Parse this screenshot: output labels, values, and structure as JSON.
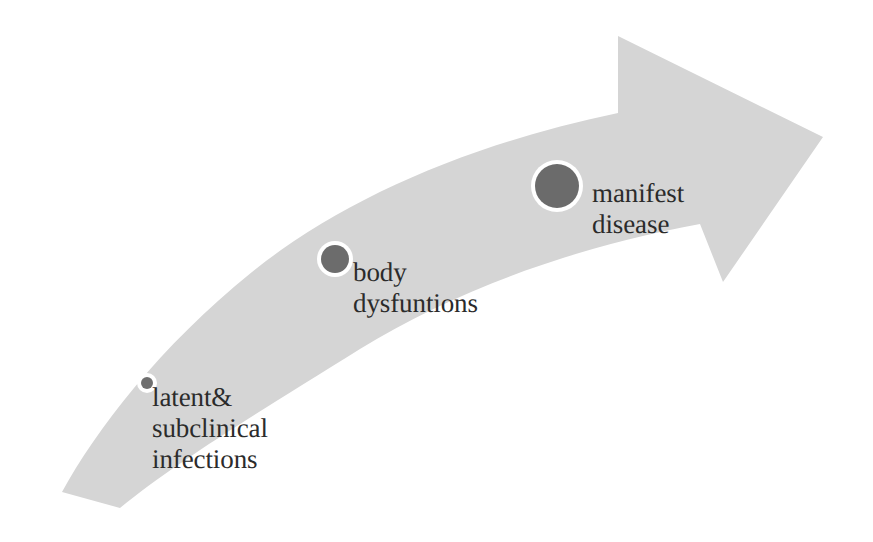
{
  "diagram": {
    "type": "process-arrow",
    "background_color": "#ffffff",
    "arrow": {
      "name": "curved-progression-arrow",
      "fill_color": "#d5d5d5",
      "direction": "left-to-right ascending",
      "description": "tapered curved arrow sweeping from lower-left to upper-right ending in an arrowhead"
    },
    "stages": [
      {
        "id": "latent",
        "label": "latent&\nsubclinical\ninfections",
        "marker_name": "stage-marker-latent",
        "marker_color": "#6f6f6f",
        "marker_diameter": 12,
        "marker_cx": 147,
        "marker_cy": 383
      },
      {
        "id": "body-dysfunctions",
        "label": "body\ndysfuntions",
        "marker_name": "stage-marker-body-dysfunctions",
        "marker_color": "#6c6c6c",
        "marker_diameter": 28,
        "marker_cx": 335,
        "marker_cy": 259
      },
      {
        "id": "manifest-disease",
        "label": "manifest\ndisease",
        "marker_name": "stage-marker-manifest-disease",
        "marker_color": "#6b6b6b",
        "marker_diameter": 44,
        "marker_cx": 557,
        "marker_cy": 186
      }
    ]
  }
}
